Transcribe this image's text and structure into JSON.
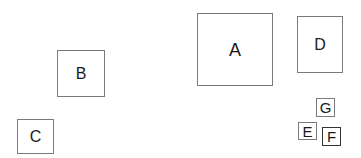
{
  "diagram": {
    "nodes": [
      {
        "id": "A",
        "label": "A",
        "x": 197,
        "y": 13,
        "w": 76,
        "h": 73,
        "font": 18
      },
      {
        "id": "B",
        "label": "B",
        "x": 57,
        "y": 50,
        "w": 48,
        "h": 47,
        "font": 16
      },
      {
        "id": "C",
        "label": "C",
        "x": 17,
        "y": 119,
        "w": 37,
        "h": 35,
        "font": 16
      },
      {
        "id": "D",
        "label": "D",
        "x": 297,
        "y": 16,
        "w": 46,
        "h": 57,
        "font": 16
      },
      {
        "id": "G",
        "label": "G",
        "x": 316,
        "y": 98,
        "w": 19,
        "h": 19,
        "font": 14
      },
      {
        "id": "E",
        "label": "E",
        "x": 298,
        "y": 122,
        "w": 19,
        "h": 18,
        "font": 14
      },
      {
        "id": "F",
        "label": "F",
        "x": 322,
        "y": 127,
        "w": 19,
        "h": 19,
        "font": 14
      }
    ]
  }
}
